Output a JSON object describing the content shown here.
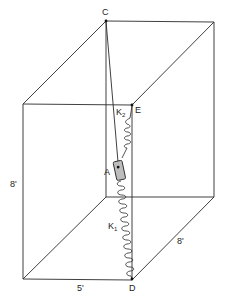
{
  "figure": {
    "points": {
      "C": "C",
      "E": "E",
      "A": "A",
      "D": "D"
    },
    "springs": {
      "k1": {
        "base": "K",
        "sub": "1"
      },
      "k2": {
        "base": "K",
        "sub": "2"
      }
    },
    "dimensions": {
      "height": "8'",
      "width": "5'",
      "depth": "8'"
    },
    "colors": {
      "line": "#2a2a2a",
      "collar_fill": "#bdbdbd",
      "background": "#ffffff"
    }
  }
}
